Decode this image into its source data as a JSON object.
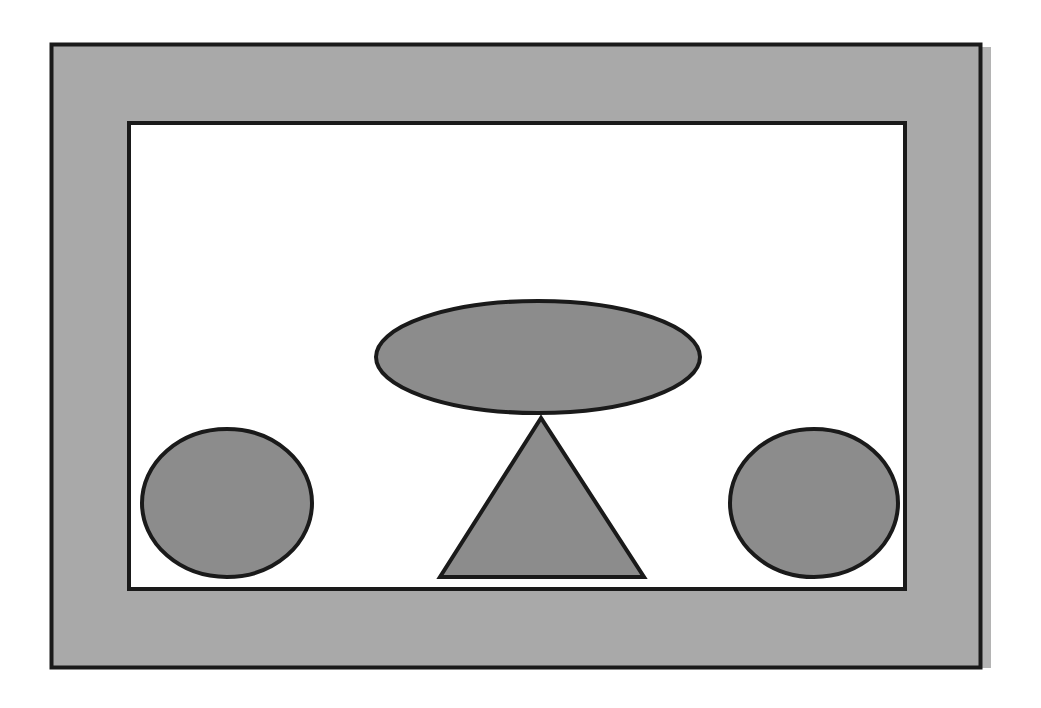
{
  "diagram": {
    "colors": {
      "background": "#ffffff",
      "frame_fill": "#a9a9a9",
      "frame_shadow": "#b4b4b4",
      "panel_fill": "#ffffff",
      "shape_fill": "#8c8c8c",
      "stroke": "#1a1a1a"
    },
    "shapes": [
      {
        "id": "top-ellipse",
        "kind": "ellipse",
        "label": ""
      },
      {
        "id": "center-triangle",
        "kind": "triangle",
        "label": ""
      },
      {
        "id": "left-circle",
        "kind": "circle",
        "label": ""
      },
      {
        "id": "right-circle",
        "kind": "circle",
        "label": ""
      }
    ]
  }
}
